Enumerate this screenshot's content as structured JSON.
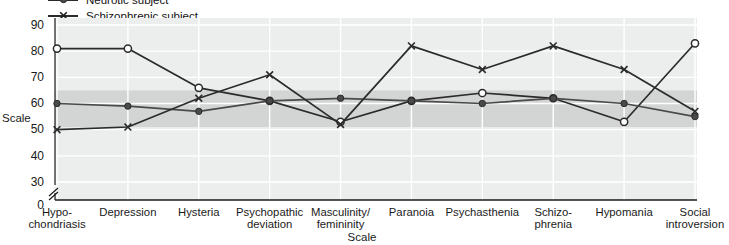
{
  "chart_data": {
    "type": "line",
    "title": "",
    "subtitle": "",
    "xlabel": "Scale",
    "ylabel": "Scale",
    "ylim": [
      30,
      90
    ],
    "yticks": [
      90,
      80,
      70,
      60,
      50,
      40,
      30,
      0
    ],
    "axis_break": true,
    "grid": true,
    "legend_position": "top-left",
    "normal_band": {
      "label": "normal range",
      "from": 51,
      "to": 65
    },
    "categories": [
      "Hypo-\nchondriasis",
      "Depression",
      "Hysteria",
      "Psychopathic\ndeviation",
      "Masculinity/\nfemininity",
      "Paranoia",
      "Psychasthenia",
      "Schizo-\nphrenia",
      "Hypomania",
      "Social\nintroversion"
    ],
    "series": [
      {
        "name": "Normal subject",
        "marker": "open-circle",
        "color": "#2b2b2b",
        "values": [
          81,
          81,
          66,
          61,
          53,
          61,
          64,
          62,
          53,
          83
        ]
      },
      {
        "name": "Neurotic subject",
        "marker": "filled-circle",
        "color": "#4a4a4a",
        "values": [
          60,
          59,
          57,
          61,
          62,
          61,
          60,
          62,
          60,
          55
        ]
      },
      {
        "name": "Schizophrenic subject",
        "marker": "cross",
        "color": "#2b2b2b",
        "values": [
          50,
          51,
          62,
          71,
          52,
          82,
          73,
          82,
          73,
          57
        ]
      }
    ]
  },
  "legend": {
    "items": [
      {
        "label": "Neurotic subject",
        "marker": "filled-circle",
        "cut_off": true
      },
      {
        "label": "Schizophrenic subject",
        "marker": "cross",
        "cut_off": false
      }
    ]
  },
  "axis": {
    "y_title": "Scale",
    "x_title": "Scale",
    "y_ticks": [
      "90",
      "80",
      "70",
      "60",
      "50",
      "40",
      "30",
      "0"
    ],
    "zero_label": "0"
  },
  "categories_display": [
    {
      "line1": "Hypo-",
      "line2": "chondriasis"
    },
    {
      "line1": "Depression",
      "line2": ""
    },
    {
      "line1": "Hysteria",
      "line2": ""
    },
    {
      "line1": "Psychopathic",
      "line2": "deviation"
    },
    {
      "line1": "Masculinity/",
      "line2": "femininity"
    },
    {
      "line1": "Paranoia",
      "line2": ""
    },
    {
      "line1": "Psychasthenia",
      "line2": ""
    },
    {
      "line1": "Schizo-",
      "line2": "phrenia"
    },
    {
      "line1": "Hypomania",
      "line2": ""
    },
    {
      "line1": "Social",
      "line2": "introversion"
    }
  ],
  "colors": {
    "plot_background": "#eceded",
    "band": "#d3d4d4",
    "grid": "#ffffff",
    "line": "#2b2b2b",
    "line_mid": "#4f4f4f",
    "text": "#111111"
  }
}
